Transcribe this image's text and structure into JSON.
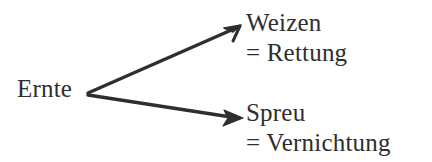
{
  "diagram": {
    "title_text": "",
    "language": "de",
    "background_color": "#ffffff",
    "ink_color": "#2e2e2e",
    "source": {
      "label": "Ernte"
    },
    "branches": [
      {
        "id": "wheat",
        "label": "Weizen",
        "equals_label": "= Rettung",
        "arrow_name": "arrow-to-weizen"
      },
      {
        "id": "chaff",
        "label": "Spreu",
        "equals_label": "= Vernichtung",
        "arrow_name": "arrow-to-spreu"
      }
    ]
  }
}
